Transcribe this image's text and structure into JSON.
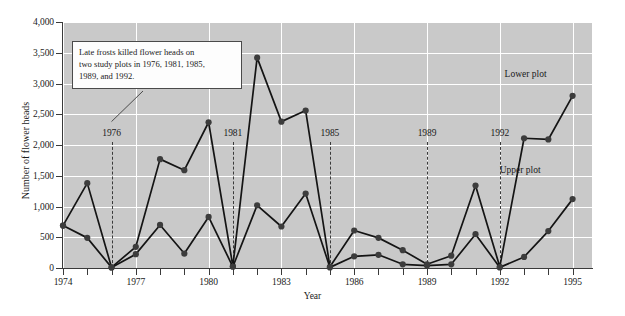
{
  "chart_data": {
    "type": "line",
    "title": "",
    "xlabel": "Year",
    "ylabel": "Number of flower heads",
    "xlim": [
      1974,
      1995.8
    ],
    "ylim": [
      0,
      4000
    ],
    "grid": true,
    "y_ticks": [
      0,
      500,
      1000,
      1500,
      2000,
      2500,
      3000,
      3500,
      4000
    ],
    "y_tick_labels": [
      "0",
      "500",
      "1,000",
      "1,500",
      "2,000",
      "2,500",
      "3,000",
      "3,500",
      "4,000"
    ],
    "x_ticks": [
      1974,
      1975,
      1976,
      1977,
      1978,
      1979,
      1980,
      1981,
      1982,
      1983,
      1984,
      1985,
      1986,
      1987,
      1988,
      1989,
      1990,
      1991,
      1992,
      1993,
      1994,
      1995
    ],
    "x_tick_labels": [
      {
        "year": 1974,
        "label": "1974"
      },
      {
        "year": 1977,
        "label": "1977"
      },
      {
        "year": 1980,
        "label": "1980"
      },
      {
        "year": 1983,
        "label": "1983"
      },
      {
        "year": 1986,
        "label": "1986"
      },
      {
        "year": 1989,
        "label": "1989"
      },
      {
        "year": 1992,
        "label": "1992"
      },
      {
        "year": 1995,
        "label": "1995"
      }
    ],
    "series": [
      {
        "name": "Lower plot",
        "x": [
          1974,
          1975,
          1976,
          1977,
          1978,
          1979,
          1980,
          1981,
          1982,
          1983,
          1984,
          1985,
          1986,
          1987,
          1988,
          1989,
          1990,
          1991,
          1992,
          1993,
          1994,
          1995
        ],
        "values": [
          690,
          1380,
          10,
          345,
          1770,
          1590,
          2370,
          30,
          3420,
          2380,
          2560,
          20,
          610,
          490,
          290,
          60,
          200,
          1340,
          20,
          2110,
          2090,
          2800
        ]
      },
      {
        "name": "Upper plot",
        "x": [
          1974,
          1975,
          1976,
          1977,
          1978,
          1979,
          1980,
          1981,
          1982,
          1983,
          1984,
          1985,
          1986,
          1987,
          1988,
          1989,
          1990,
          1991,
          1992,
          1993,
          1994,
          1995
        ],
        "values": [
          690,
          490,
          10,
          225,
          700,
          235,
          830,
          20,
          1020,
          675,
          1210,
          10,
          190,
          215,
          60,
          40,
          60,
          550,
          10,
          180,
          600,
          1120
        ]
      }
    ],
    "series_labels": [
      {
        "name": "Lower plot",
        "x": 1993.6,
        "y": 3120
      },
      {
        "name": "Upper plot",
        "x": 1993.4,
        "y": 1560
      }
    ],
    "frost_years": [
      {
        "year": 1976,
        "label": "1976"
      },
      {
        "year": 1981,
        "label": "1981"
      },
      {
        "year": 1985,
        "label": "1985"
      },
      {
        "year": 1989,
        "label": "1989"
      },
      {
        "year": 1992,
        "label": "1992"
      }
    ],
    "frost_label_y": 2180,
    "annotation": {
      "lines": [
        "Late frosts killed flower heads on",
        "two study plots in 1976, 1981, 1985,",
        "1989, and 1992."
      ],
      "pointer_to": {
        "year": 1976,
        "y": 2380
      }
    },
    "colors": {
      "plot_background": "#c9c9c9",
      "gridlines": "#ffffff",
      "line": "#141414",
      "marker": "#3c3c3c",
      "axis": "#3a3a3a",
      "frost_dash": "#3a3a3a",
      "callout_background": "#fdfdfd",
      "callout_border": "#4a4a4a",
      "page_background": "#ffffff"
    }
  }
}
